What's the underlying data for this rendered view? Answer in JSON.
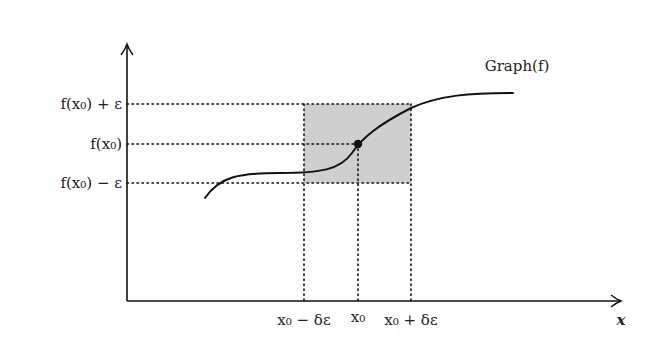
{
  "diagram": {
    "curve_label": "Graph(f)",
    "x_axis_label": "x",
    "y_labels": {
      "upper": "f(x₀) + ε",
      "middle": "f(x₀)",
      "lower": "f(x₀) − ε"
    },
    "x_labels": {
      "left": "x₀ − δε",
      "center": "x₀",
      "right": "x₀ + δε"
    },
    "colors": {
      "axis": "#111111",
      "curve": "#111111",
      "box_fill": "#cfcfcf",
      "dotted": "#111111"
    }
  }
}
